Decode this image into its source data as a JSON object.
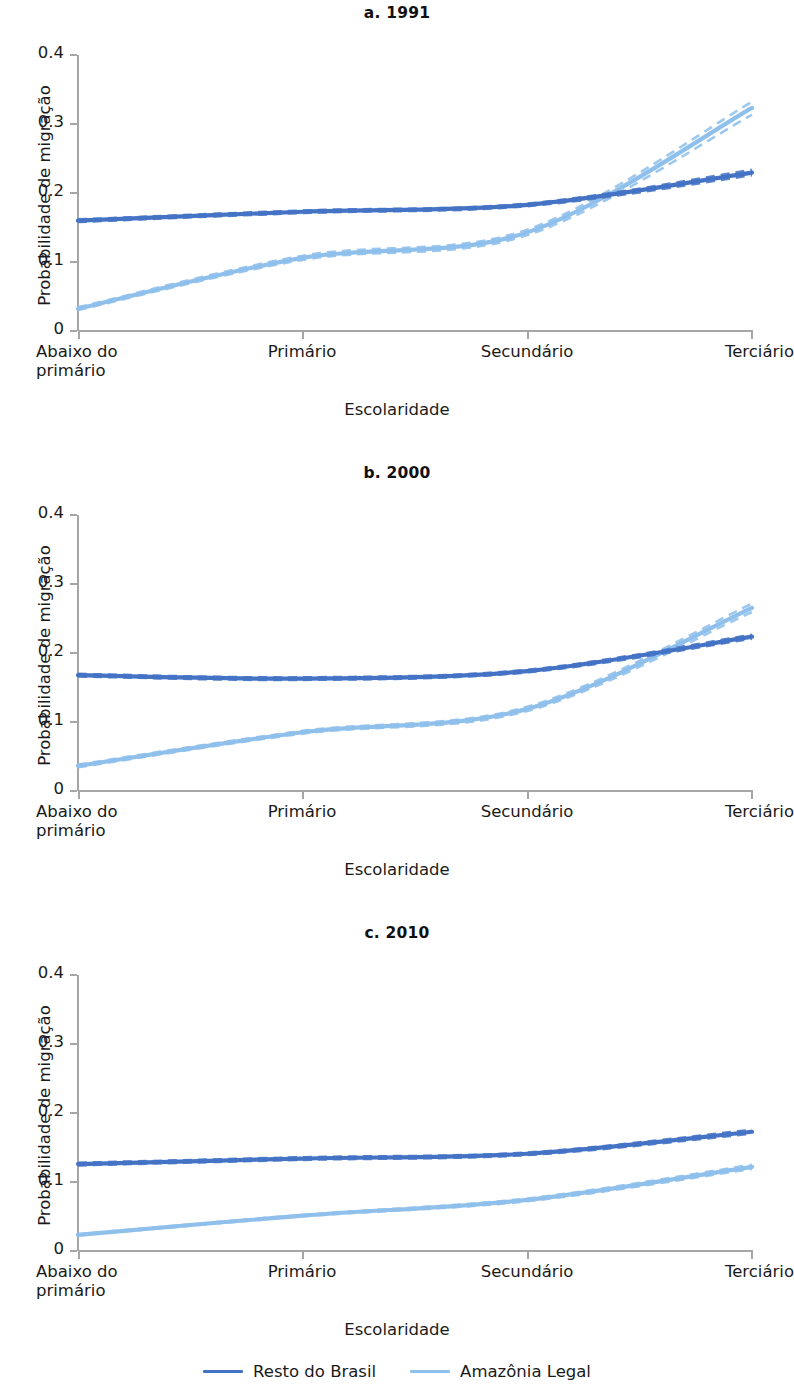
{
  "figure": {
    "xlabel": "Escolaridade",
    "ylabel": "Probabilidade de migração"
  },
  "axis": {
    "yticks": [
      "0.4",
      "0.3",
      "0.2",
      "0.1",
      "0"
    ],
    "xticks": [
      "Abaixo do\nprimário",
      "Primário",
      "Secundário",
      "Terciário"
    ],
    "xtick_line1": [
      "Abaixo do",
      "Primário",
      "Secundário",
      "Terciário"
    ],
    "xtick_line2": [
      "primário",
      "",
      "",
      ""
    ]
  },
  "legend": {
    "items": [
      {
        "label": "Resto do Brasil",
        "color": "#4472C4"
      },
      {
        "label": "Amazônia Legal",
        "color": "#8FC0EC"
      }
    ]
  },
  "colors": {
    "resto_do_brasil": "#4472C4",
    "amazonia_legal": "#8FC0EC",
    "axis": "#a6a6a6",
    "text": "#1a1a1a"
  },
  "panels": [
    {
      "id": "a",
      "title": "a. 1991"
    },
    {
      "id": "b",
      "title": "b. 2000"
    },
    {
      "id": "c",
      "title": "c. 2010"
    }
  ],
  "chart_data": [
    {
      "type": "line",
      "title": "a. 1991",
      "xlabel": "Escolaridade",
      "ylabel": "Probabilidade de migração",
      "categories": [
        "Abaixo do primário",
        "Primário",
        "Secundário",
        "Terciário"
      ],
      "ylim": [
        0,
        0.4
      ],
      "yticks": [
        0,
        0.1,
        0.2,
        0.3,
        0.4
      ],
      "grid": false,
      "legend_position": "bottom",
      "series": [
        {
          "name": "Resto do Brasil",
          "color": "#4472C4",
          "values": [
            0.159,
            0.172,
            0.182,
            0.229
          ],
          "ci_lower": [
            0.157,
            0.17,
            0.18,
            0.225
          ],
          "ci_upper": [
            0.161,
            0.174,
            0.184,
            0.233
          ]
        },
        {
          "name": "Amazônia Legal",
          "color": "#8FC0EC",
          "values": [
            0.031,
            0.105,
            0.142,
            0.323
          ],
          "ci_lower": [
            0.029,
            0.102,
            0.138,
            0.313
          ],
          "ci_upper": [
            0.033,
            0.108,
            0.146,
            0.332
          ]
        }
      ]
    },
    {
      "type": "line",
      "title": "b. 2000",
      "xlabel": "Escolaridade",
      "ylabel": "Probabilidade de migração",
      "categories": [
        "Abaixo do primário",
        "Primário",
        "Secundário",
        "Terciário"
      ],
      "ylim": [
        0,
        0.4
      ],
      "yticks": [
        0,
        0.1,
        0.2,
        0.3,
        0.4
      ],
      "grid": false,
      "legend_position": "bottom",
      "series": [
        {
          "name": "Resto do Brasil",
          "color": "#4472C4",
          "values": [
            0.167,
            0.162,
            0.173,
            0.223
          ],
          "ci_lower": [
            0.165,
            0.16,
            0.171,
            0.22
          ],
          "ci_upper": [
            0.169,
            0.164,
            0.175,
            0.226
          ]
        },
        {
          "name": "Amazônia Legal",
          "color": "#8FC0EC",
          "values": [
            0.035,
            0.084,
            0.118,
            0.265
          ],
          "ci_lower": [
            0.033,
            0.082,
            0.115,
            0.259
          ],
          "ci_upper": [
            0.037,
            0.086,
            0.121,
            0.271
          ]
        }
      ]
    },
    {
      "type": "line",
      "title": "c. 2010",
      "xlabel": "Escolaridade",
      "ylabel": "Probabilidade de migração",
      "categories": [
        "Abaixo do primário",
        "Primário",
        "Secundário",
        "Terciário"
      ],
      "ylim": [
        0,
        0.4
      ],
      "yticks": [
        0,
        0.1,
        0.2,
        0.3,
        0.4
      ],
      "grid": false,
      "legend_position": "bottom",
      "series": [
        {
          "name": "Resto do Brasil",
          "color": "#4472C4",
          "values": [
            0.125,
            0.133,
            0.14,
            0.172
          ],
          "ci_lower": [
            0.123,
            0.131,
            0.138,
            0.169
          ],
          "ci_upper": [
            0.127,
            0.135,
            0.142,
            0.175
          ]
        },
        {
          "name": "Amazônia Legal",
          "color": "#8FC0EC",
          "values": [
            0.022,
            0.05,
            0.073,
            0.121
          ],
          "ci_lower": [
            0.021,
            0.049,
            0.071,
            0.118
          ],
          "ci_upper": [
            0.023,
            0.051,
            0.075,
            0.124
          ]
        }
      ]
    }
  ]
}
